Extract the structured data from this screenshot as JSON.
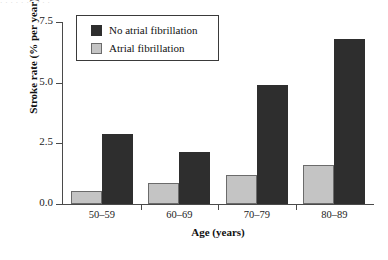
{
  "artifact": {
    "top_sliver_text": "· · ·   ·   · · ·   ·   · ·"
  },
  "legend": {
    "position": "top-left-inside",
    "entries": [
      {
        "label": "No atrial fibrillation",
        "color": "#2e2e2e",
        "swatch": "dark-square-swatch"
      },
      {
        "label": "Atrial fibrillation",
        "color": "#c4c4c4",
        "swatch": "light-square-swatch"
      }
    ]
  },
  "chart_data": {
    "type": "bar",
    "title": "",
    "subtitle": "",
    "xlabel": "Age (years)",
    "ylabel": "Stroke rate (% per year)",
    "categories": [
      "50–59",
      "60–69",
      "70–79",
      "80–89"
    ],
    "series": [
      {
        "name": "Atrial fibrillation",
        "color": "#c4c4c4",
        "values": [
          0.55,
          0.85,
          1.2,
          1.6
        ]
      },
      {
        "name": "No atrial fibrillation",
        "color": "#2e2e2e",
        "values": [
          2.9,
          2.15,
          4.9,
          6.8
        ]
      }
    ],
    "ylim": [
      0.0,
      7.5
    ],
    "ytick_labels": [
      "0.0",
      "2.5",
      "5.0",
      "7.5"
    ],
    "ytick_values": [
      0.0,
      2.5,
      5.0,
      7.5
    ],
    "grid": false,
    "legend_position": "upper left"
  }
}
